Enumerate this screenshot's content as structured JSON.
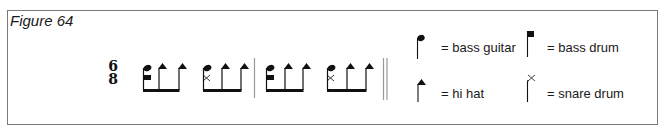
{
  "figure": {
    "title": "Figure 64"
  },
  "time_signature": {
    "top": "6",
    "bottom": "8"
  },
  "measures": [
    {
      "groups": [
        {
          "beats": [
            "bass-guitar+bass-drum",
            "hi-hat",
            "hi-hat"
          ]
        },
        {
          "beats": [
            "bass-guitar+snare-drum",
            "hi-hat",
            "hi-hat"
          ]
        }
      ]
    },
    {
      "groups": [
        {
          "beats": [
            "bass-guitar+bass-drum",
            "hi-hat",
            "hi-hat"
          ]
        },
        {
          "beats": [
            "bass-guitar+snare-drum",
            "hi-hat",
            "hi-hat"
          ]
        }
      ]
    }
  ],
  "legend": [
    {
      "symbol": "oval-notehead",
      "label": "= bass guitar"
    },
    {
      "symbol": "square-notehead",
      "label": "= bass drum"
    },
    {
      "symbol": "triangle-notehead",
      "label": "= hi hat"
    },
    {
      "symbol": "x-notehead",
      "label": "= snare drum"
    }
  ],
  "colors": {
    "ink": "#111111",
    "frame": "#7a7a7a",
    "barline": "#9a9a9a"
  }
}
